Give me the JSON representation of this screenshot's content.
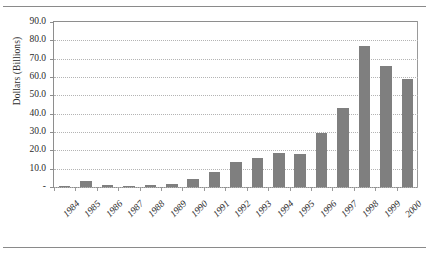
{
  "chart_data": {
    "type": "bar",
    "title": "",
    "xlabel": "",
    "ylabel": "Dollars (Billions)",
    "categories": [
      "1984",
      "1985",
      "1986",
      "1987",
      "1988",
      "1989",
      "1990",
      "1991",
      "1992",
      "1993",
      "1994",
      "1995",
      "1996",
      "1997",
      "1998",
      "1999",
      "2000"
    ],
    "values": [
      0.2,
      3.5,
      1.0,
      0.7,
      1.2,
      1.5,
      4.5,
      8.0,
      13.5,
      16.0,
      18.5,
      18.0,
      29.5,
      43.0,
      77.0,
      66.0,
      59.0
    ],
    "ylim": [
      0,
      90
    ],
    "ytick_labels": [
      "90.0",
      "80.0",
      "70.0",
      "60.0",
      "50.0",
      "40.0",
      "30.0",
      "20.0",
      "10.0",
      "-"
    ],
    "ytick_values": [
      90,
      80,
      70,
      60,
      50,
      40,
      30,
      20,
      10,
      0
    ],
    "grid": true,
    "legend": "none",
    "bar_color": "#7f7f7f",
    "grid_color": "#b4b4b4",
    "axis_color": "#8e8e8e"
  }
}
